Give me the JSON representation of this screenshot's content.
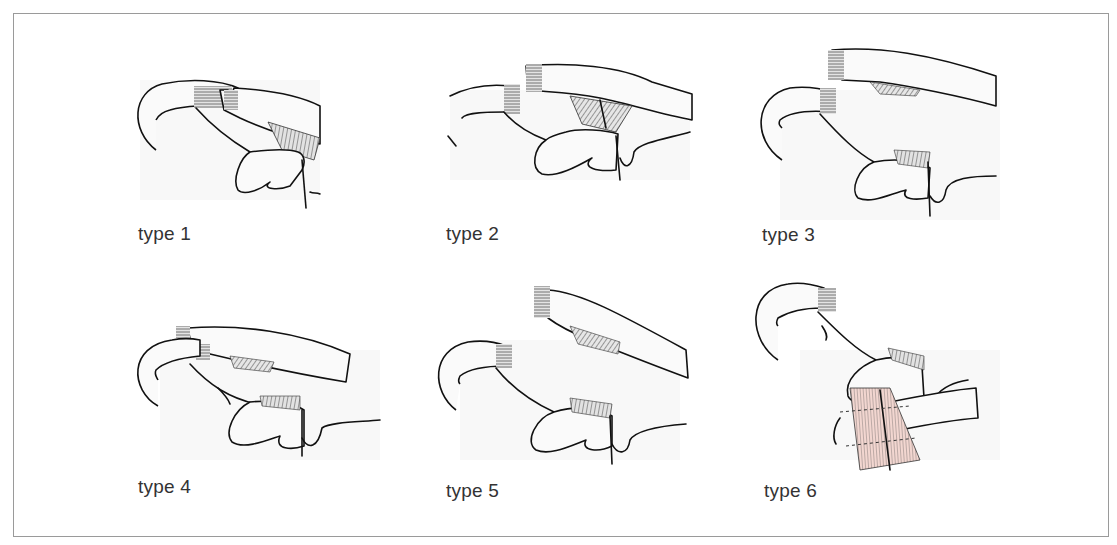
{
  "figure": {
    "title": "",
    "panels": [
      {
        "id": "type-1",
        "label": "type 1"
      },
      {
        "id": "type-2",
        "label": "type 2"
      },
      {
        "id": "type-3",
        "label": "type 3"
      },
      {
        "id": "type-4",
        "label": "type 4"
      },
      {
        "id": "type-5",
        "label": "type 5"
      },
      {
        "id": "type-6",
        "label": "type 6"
      }
    ],
    "colors": {
      "line": "#111111",
      "hatch": "#555555",
      "muscle_tint": "#f2d6d0",
      "border": "#9a9a9a"
    }
  }
}
